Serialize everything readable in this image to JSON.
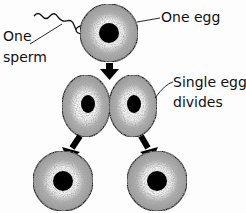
{
  "diagram": {
    "labels": {
      "one_egg": "One egg",
      "one_sperm_line1": "One",
      "one_sperm_line2": "sperm",
      "single_egg_line1": "Single egg",
      "single_egg_line2": "divides"
    },
    "nodes": [
      {
        "id": "egg",
        "label": "One egg",
        "cx": 109,
        "cy": 33
      },
      {
        "id": "cell-left",
        "cx": 86,
        "cy": 106
      },
      {
        "id": "cell-right",
        "cx": 133,
        "cy": 106
      },
      {
        "id": "twin-left",
        "cx": 63,
        "cy": 181
      },
      {
        "id": "twin-right",
        "cx": 157,
        "cy": 181
      }
    ],
    "edges": [
      {
        "from": "egg",
        "to": "cell-pair"
      },
      {
        "from": "cell-left",
        "to": "twin-left"
      },
      {
        "from": "cell-right",
        "to": "twin-right"
      }
    ],
    "colors": {
      "cytoplasm": "#a9a9a9",
      "nucleus": "#000000",
      "halo": "#e8e8e8",
      "outline": "#222222"
    }
  }
}
